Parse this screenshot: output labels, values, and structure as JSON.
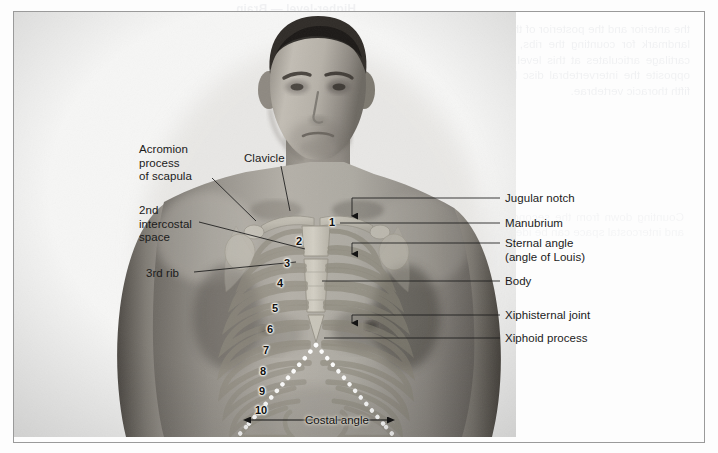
{
  "figure": {
    "name": "surface-anatomy-thorax-photograph",
    "subject_description": "Frontal photograph of a man's bare chest with the rib cage and sternum drawn over the skin"
  },
  "labels_left": [
    {
      "id": "acromion-process-of-scapula",
      "text": "Acromion\nprocess\nof scapula",
      "x": 139,
      "y": 143
    },
    {
      "id": "2nd-intercostal-space",
      "text": "2nd\nintercostal\nspace",
      "x": 139,
      "y": 204
    },
    {
      "id": "3rd-rib",
      "text": "3rd rib",
      "x": 146,
      "y": 267
    },
    {
      "id": "clavicle",
      "text": "Clavicle",
      "x": 244,
      "y": 152
    }
  ],
  "labels_right": [
    {
      "id": "jugular-notch",
      "text": "Jugular notch",
      "x": 505,
      "y": 192
    },
    {
      "id": "manubrium",
      "text": "Manubrium",
      "x": 505,
      "y": 218
    },
    {
      "id": "sternal-angle",
      "text": "Sternal angle\n(angle of Louis)",
      "x": 505,
      "y": 237
    },
    {
      "id": "body",
      "text": "Body",
      "x": 505,
      "y": 275
    },
    {
      "id": "xiphisternal-joint",
      "text": "Xiphisternal joint",
      "x": 505,
      "y": 309
    },
    {
      "id": "xiphoid-process",
      "text": "Xiphoid process",
      "x": 505,
      "y": 332
    }
  ],
  "rib_numbers": [
    {
      "n": "1",
      "x": 332,
      "y": 222
    },
    {
      "n": "2",
      "x": 299,
      "y": 241
    },
    {
      "n": "3",
      "x": 287,
      "y": 263
    },
    {
      "n": "4",
      "x": 280,
      "y": 283
    },
    {
      "n": "5",
      "x": 275,
      "y": 308
    },
    {
      "n": "6",
      "x": 270,
      "y": 329
    },
    {
      "n": "7",
      "x": 266,
      "y": 350
    },
    {
      "n": "8",
      "x": 263,
      "y": 371
    },
    {
      "n": "9",
      "x": 262,
      "y": 391
    },
    {
      "n": "10",
      "x": 261,
      "y": 410
    }
  ],
  "annotations": {
    "costal_angle_label": "Costal angle",
    "costal_angle_label_x": 305,
    "costal_angle_label_y": 415
  },
  "bleed_through": {
    "heading": "Higher-level — Brain",
    "column_a": "the anterior and the posterior of the thorax wall is a useful landmark for counting the ribs, and the second costal cartilage articulates at this level. The sternal angle lies opposite the intervertebral disc between the fourth and fifth thoracic vertebrae.",
    "column_b": "The manubrium articulates with the body of the sternum at the sternal angle, which is felt as a transverse ridge. The xiphoid process forms the inferior part of the sternum and is cartilaginous in young adults.",
    "column_c": "Counting down from the second rib each successive rib and intercostal space can be identified in turn.",
    "column_d": "The costal margin is formed by the cartilages of the seventh to the tenth ribs and ends at the tenth rib."
  },
  "colors": {
    "frame_rule": "#9a9a9a",
    "label_text": "#1b1b1b",
    "leader_line": "#1a1a1a",
    "costal_dots": "#ffffff",
    "page_background": "#fdfdfd"
  }
}
